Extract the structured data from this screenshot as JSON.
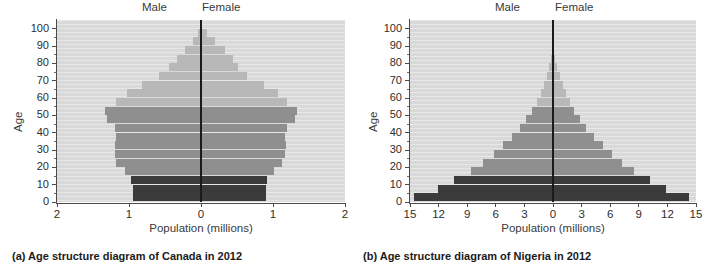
{
  "figure": {
    "panels": [
      {
        "id": "canada",
        "caption": "(a) Age structure diagram of Canada in 2012",
        "male_label": "Male",
        "female_label": "Female",
        "x_axis_title": "Population (millions)",
        "y_axis_title": "Age"
      },
      {
        "id": "nigeria",
        "caption": "(b) Age structure diagram of Nigeria in 2012",
        "male_label": "Male",
        "female_label": "Female",
        "x_axis_title": "Population (millions)",
        "y_axis_title": "Age"
      }
    ]
  },
  "colors": {
    "plot_background": "#d9d9d9",
    "stripe": "#e9e9e9",
    "pre_reproductive": "#3b3b3b",
    "reproductive": "#8f8f8f",
    "post_reproductive": "#b8b8b8",
    "axis": "#4a4a4a",
    "centerline": "#1a1a1a",
    "text": "#2d2d2d"
  },
  "chart_data": [
    {
      "type": "bar",
      "subtype": "population-pyramid",
      "title": "(a) Age structure diagram of Canada in 2012",
      "country": "Canada",
      "year": 2012,
      "xlabel": "Population (millions)",
      "ylabel": "Age",
      "xlim": [
        -2,
        2
      ],
      "ylim": [
        0,
        105
      ],
      "x_tick_labels": [
        "2",
        "1",
        "0",
        "1",
        "2"
      ],
      "x_tick_values": [
        -2,
        -1,
        0,
        1,
        2
      ],
      "y_tick_labels": [
        "0",
        "10",
        "20",
        "30",
        "40",
        "50",
        "60",
        "70",
        "80",
        "90",
        "100"
      ],
      "y_tick_values": [
        0,
        10,
        20,
        30,
        40,
        50,
        60,
        70,
        80,
        90,
        100
      ],
      "grid": true,
      "legend": "none",
      "units": "millions",
      "age_groups": [
        "0-4",
        "5-9",
        "10-14",
        "15-19",
        "20-24",
        "25-29",
        "30-34",
        "35-39",
        "40-44",
        "45-49",
        "50-54",
        "55-59",
        "60-64",
        "65-69",
        "70-74",
        "75-79",
        "80-84",
        "85-89",
        "90-94",
        "95-99",
        "100+"
      ],
      "group_shades": [
        "pre",
        "pre",
        "pre",
        "repro",
        "repro",
        "repro",
        "repro",
        "repro",
        "repro",
        "repro",
        "repro",
        "post",
        "post",
        "post",
        "post",
        "post",
        "post",
        "post",
        "post",
        "post",
        "post"
      ],
      "series": [
        {
          "name": "Male",
          "side": "left",
          "values": [
            0.95,
            0.95,
            0.97,
            1.06,
            1.18,
            1.2,
            1.19,
            1.18,
            1.2,
            1.3,
            1.34,
            1.18,
            1.03,
            0.82,
            0.58,
            0.44,
            0.34,
            0.22,
            0.11,
            0.04,
            0.01
          ]
        },
        {
          "name": "Female",
          "side": "right",
          "values": [
            0.9,
            0.9,
            0.92,
            1.01,
            1.13,
            1.17,
            1.18,
            1.17,
            1.19,
            1.3,
            1.34,
            1.2,
            1.07,
            0.87,
            0.64,
            0.52,
            0.45,
            0.34,
            0.2,
            0.08,
            0.02
          ]
        }
      ]
    },
    {
      "type": "bar",
      "subtype": "population-pyramid",
      "title": "(b) Age structure diagram of Nigeria in 2012",
      "country": "Nigeria",
      "year": 2012,
      "xlabel": "Population (millions)",
      "ylabel": "Age",
      "xlim": [
        -15,
        15
      ],
      "ylim": [
        0,
        105
      ],
      "x_tick_labels": [
        "15",
        "12",
        "9",
        "6",
        "3",
        "0",
        "3",
        "6",
        "9",
        "12",
        "15"
      ],
      "x_tick_values": [
        -15,
        -12,
        -9,
        -6,
        -3,
        0,
        3,
        6,
        9,
        12,
        15
      ],
      "y_tick_labels": [
        "0",
        "10",
        "20",
        "30",
        "40",
        "50",
        "60",
        "70",
        "80",
        "90",
        "100"
      ],
      "y_tick_values": [
        0,
        10,
        20,
        30,
        40,
        50,
        60,
        70,
        80,
        90,
        100
      ],
      "grid": true,
      "legend": "none",
      "units": "millions",
      "age_groups": [
        "0-4",
        "5-9",
        "10-14",
        "15-19",
        "20-24",
        "25-29",
        "30-34",
        "35-39",
        "40-44",
        "45-49",
        "50-54",
        "55-59",
        "60-64",
        "65-69",
        "70-74",
        "75-79",
        "80-84",
        "85-89",
        "90-94",
        "95-99",
        "100+"
      ],
      "group_shades": [
        "pre",
        "pre",
        "pre",
        "repro",
        "repro",
        "repro",
        "repro",
        "repro",
        "repro",
        "repro",
        "repro",
        "post",
        "post",
        "post",
        "post",
        "post",
        "post",
        "post",
        "post",
        "post",
        "post"
      ],
      "series": [
        {
          "name": "Male",
          "side": "left",
          "values": [
            14.6,
            12.1,
            10.4,
            8.6,
            7.3,
            6.2,
            5.2,
            4.3,
            3.5,
            2.8,
            2.2,
            1.7,
            1.3,
            0.95,
            0.65,
            0.4,
            0.22,
            0.1,
            0.04,
            0.01,
            0.0
          ]
        },
        {
          "name": "Female",
          "side": "right",
          "values": [
            14.3,
            11.9,
            10.2,
            8.5,
            7.2,
            6.2,
            5.2,
            4.3,
            3.5,
            2.8,
            2.2,
            1.8,
            1.4,
            1.05,
            0.72,
            0.45,
            0.25,
            0.12,
            0.05,
            0.01,
            0.0
          ]
        }
      ]
    }
  ]
}
